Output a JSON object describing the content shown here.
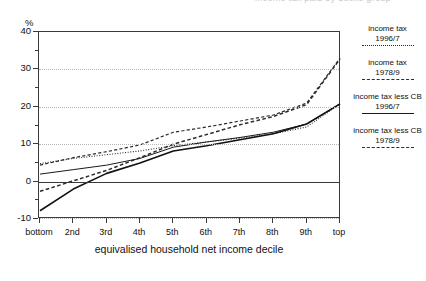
{
  "title_strip": "income tax paid by decile group",
  "axes": {
    "y_unit": "%",
    "x_axis_title": "equivalised household net income decile",
    "y_ticks": [
      "40",
      "30",
      "20",
      "10",
      "0",
      "-10"
    ],
    "x_ticks": [
      "bottom",
      "2nd",
      "3rd",
      "4th",
      "5th",
      "6th",
      "7th",
      "8th",
      "9th",
      "top"
    ]
  },
  "legend": {
    "items": [
      {
        "line1": "income tax",
        "line2": "1996/7",
        "style": "dotted"
      },
      {
        "line1": "income tax",
        "line2": "1978/9",
        "style": "dashed-fine"
      },
      {
        "line1": "income tax less CB",
        "line2": "1996/7",
        "style": "solid"
      },
      {
        "line1": "income tax less CB",
        "line2": "1978/9",
        "style": "dashed-wide"
      }
    ]
  },
  "chart_data": {
    "type": "line",
    "title": "income tax paid by decile group",
    "xlabel": "equivalised household net income decile",
    "ylabel": "%",
    "categories": [
      "bottom",
      "2nd",
      "3rd",
      "4th",
      "5th",
      "6th",
      "7th",
      "8th",
      "9th",
      "top"
    ],
    "ylim": [
      -10,
      40
    ],
    "yticks": [
      -10,
      0,
      10,
      20,
      30,
      40
    ],
    "grid": true,
    "legend_position": "right",
    "series": [
      {
        "name": "income tax 1996/7",
        "style": "dotted",
        "values": [
          4.8,
          6.2,
          7.2,
          8.2,
          9.6,
          10.6,
          11.6,
          12.8,
          14.6,
          20.8
        ]
      },
      {
        "name": "income tax 1978/9",
        "style": "dashed-fine",
        "values": [
          4.4,
          6.4,
          8.0,
          9.8,
          13.2,
          14.6,
          16.2,
          17.8,
          21.0,
          33.0
        ]
      },
      {
        "name": "income tax less CB 1996/7",
        "style": "solid",
        "values": [
          2.0,
          3.2,
          4.4,
          6.2,
          9.2,
          10.6,
          11.8,
          13.2,
          15.4,
          20.8
        ]
      },
      {
        "name": "income tax less CB 1978/9",
        "style": "dashed-wide",
        "values": [
          -2.6,
          0.2,
          3.0,
          6.4,
          10.0,
          12.6,
          15.2,
          17.4,
          20.6,
          32.8
        ]
      },
      {
        "name": "income tax less CB 1996/7 (lower solid)",
        "style": "solid-thick",
        "values": [
          -7.8,
          -2.0,
          2.2,
          5.0,
          8.2,
          9.6,
          11.2,
          12.8,
          15.4,
          20.8
        ]
      }
    ]
  }
}
